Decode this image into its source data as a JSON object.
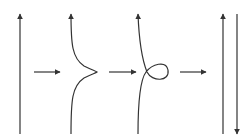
{
  "diagram": {
    "title": "",
    "stroke_color": "#333333",
    "background": "#ffffff",
    "panels": [
      {
        "id": "panel-1",
        "description": "single vertical strand, arrow up"
      },
      {
        "id": "panel-2",
        "description": "vertical strand with bump to the right, arrow up"
      },
      {
        "id": "panel-3",
        "description": "strand with a kink loop (curl), arrow up"
      },
      {
        "id": "panel-4",
        "description": "two parallel strands, left arrow up, right arrow down"
      }
    ],
    "transitions": [
      {
        "from": "panel-1",
        "to": "panel-2",
        "symbol": "right-arrow"
      },
      {
        "from": "panel-2",
        "to": "panel-3",
        "symbol": "right-arrow"
      },
      {
        "from": "panel-3",
        "to": "panel-4",
        "symbol": "right-arrow"
      }
    ]
  }
}
